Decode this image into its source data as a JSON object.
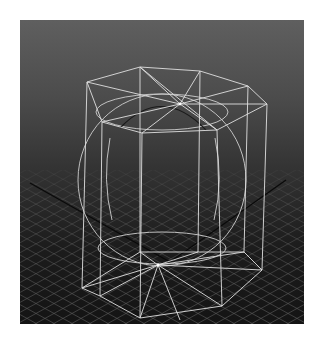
{
  "viewport": {
    "kind": "3d-perspective-viewport",
    "background_top": "#5f5f5f",
    "background_bottom": "#141414",
    "grid_color": "#5a5a5a",
    "axis_color": "#0a0a0a",
    "wire_color": "#d8d8d8"
  },
  "scene": {
    "objects": [
      {
        "name": "cylinder",
        "type": "polyCylinder",
        "display": "wireframe",
        "sides": 8
      },
      {
        "name": "sphere",
        "type": "polySphere",
        "display": "wireframe"
      },
      {
        "name": "grid",
        "type": "ground-grid",
        "display": "lines"
      }
    ]
  }
}
